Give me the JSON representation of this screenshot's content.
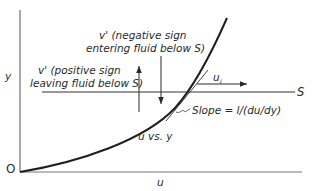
{
  "diagram": {
    "axes": {
      "y_label": "y",
      "x_label": "u",
      "origin_label": "O"
    },
    "reference_line": {
      "label": "S"
    },
    "curve": {
      "label": "u vs. y"
    },
    "tangent": {
      "label": "Slope = l/(du/dy)"
    },
    "arrows": {
      "velocity": {
        "label": "u",
        "subscript": "i"
      },
      "positive_v": {
        "line1": "v' (positive sign",
        "line2": "leaving fluid below S)"
      },
      "negative_v": {
        "line1": "v' (negative sign",
        "line2": "entering fluid below S)"
      }
    },
    "colors": {
      "ink": "#2a2a2a",
      "axis": "#555555",
      "background": "#ffffff"
    }
  }
}
